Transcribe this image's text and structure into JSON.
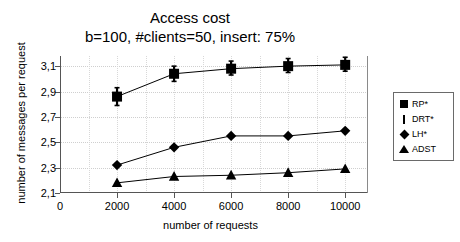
{
  "chart_data": {
    "type": "line",
    "title": "Access cost",
    "subtitle": "b=100, #clients=50, insert: 75%",
    "xlabel": "number of requests",
    "ylabel": "number of messages per request",
    "x": [
      2000,
      4000,
      6000,
      8000,
      10000
    ],
    "xlim": [
      0,
      10800
    ],
    "ylim": [
      2.1,
      3.18
    ],
    "xticks": [
      0,
      2000,
      4000,
      6000,
      8000,
      10000
    ],
    "xtick_labels": [
      "0",
      "2000",
      "4000",
      "6000",
      "8000",
      "10000"
    ],
    "yticks": [
      2.1,
      2.3,
      2.5,
      2.7,
      2.9,
      3.1
    ],
    "ytick_labels": [
      "2,1",
      "2,3",
      "2,5",
      "2,7",
      "2,9",
      "3,1"
    ],
    "grid": true,
    "legend_position": "right-outside",
    "series": [
      {
        "name": "RP*",
        "marker": "square",
        "values": [
          2.86,
          3.04,
          3.08,
          3.1,
          3.11
        ]
      },
      {
        "name": "DRT*",
        "marker": "error-bar",
        "values": [
          2.86,
          3.04,
          3.08,
          3.1,
          3.11
        ],
        "err_low": [
          0.07,
          0.06,
          0.05,
          0.05,
          0.05
        ],
        "err_high": [
          0.07,
          0.06,
          0.06,
          0.06,
          0.06
        ]
      },
      {
        "name": "LH*",
        "marker": "diamond",
        "values": [
          2.32,
          2.46,
          2.55,
          2.55,
          2.59
        ]
      },
      {
        "name": "ADST",
        "marker": "triangle",
        "values": [
          2.18,
          2.23,
          2.24,
          2.26,
          2.29
        ]
      }
    ],
    "legend_entries": [
      {
        "label": "RP*",
        "marker": "square"
      },
      {
        "label": "DRT*",
        "marker": "error-bar"
      },
      {
        "label": "LH*",
        "marker": "diamond"
      },
      {
        "label": "ADST",
        "marker": "triangle"
      }
    ],
    "colors": {
      "series": "#000000",
      "grid": "#cfcfcf",
      "axis": "#555555"
    }
  }
}
